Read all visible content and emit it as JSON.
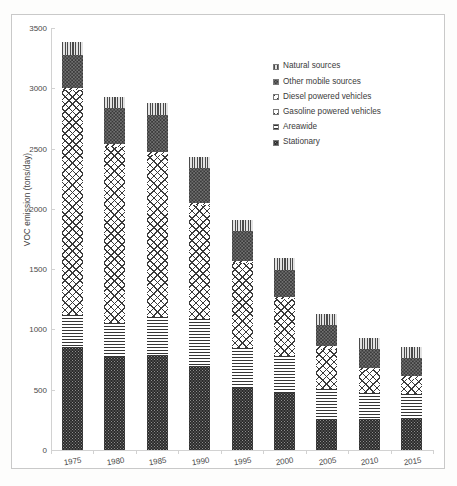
{
  "chart_data": {
    "type": "bar",
    "subtype": "stacked-vertical",
    "title": "",
    "xlabel": "",
    "ylabel": "VOC emission (tons/day)",
    "ylim": [
      0,
      3500
    ],
    "ytick_values": [
      0,
      500,
      1000,
      1500,
      2000,
      2500,
      3000,
      3500
    ],
    "ytick_labels": [
      "0",
      "500",
      "1000",
      "1500",
      "2000",
      "2500",
      "3000",
      "3500"
    ],
    "grid": false,
    "legend_position": "upper-right-inside",
    "categories": [
      "1975",
      "1980",
      "1985",
      "1990",
      "1995",
      "2000",
      "2005",
      "2010",
      "2015"
    ],
    "series": [
      {
        "name": "Stationary",
        "pattern": "dotted-dark",
        "stack_order": 1,
        "values": [
          855,
          775,
          790,
          700,
          515,
          475,
          260,
          255,
          265
        ]
      },
      {
        "name": "Areawide",
        "pattern": "horizontal-lines",
        "stack_order": 2,
        "values": [
          265,
          280,
          310,
          390,
          330,
          305,
          245,
          215,
          200
        ]
      },
      {
        "name": "Gasoline powered vehicles",
        "pattern": "cross-diagonal-hatch",
        "stack_order": 3,
        "values": [
          1865,
          1460,
          1350,
          940,
          710,
          470,
          330,
          190,
          120
        ]
      },
      {
        "name": "Diesel powered vehicles",
        "pattern": "diagonal-hatch",
        "stack_order": 4,
        "values": [
          15,
          25,
          20,
          20,
          15,
          20,
          25,
          20,
          25
        ]
      },
      {
        "name": "Other mobile sources",
        "pattern": "dotted-dark-coarse",
        "stack_order": 5,
        "values": [
          275,
          300,
          310,
          285,
          250,
          225,
          180,
          160,
          150
        ]
      },
      {
        "name": "Natural sources",
        "pattern": "vertical-lines",
        "stack_order": 6,
        "values": [
          105,
          85,
          100,
          95,
          85,
          95,
          90,
          90,
          95
        ]
      }
    ],
    "totals": [
      3380,
      2925,
      2880,
      2430,
      1905,
      1590,
      1130,
      930,
      855
    ]
  },
  "legend": {
    "items": [
      {
        "label": "Natural sources",
        "swatch": "vertical-lines-swatch"
      },
      {
        "label": "Other mobile sources",
        "swatch": "dotted-dark-coarse-swatch"
      },
      {
        "label": "Diesel powered vehicles",
        "swatch": "diagonal-hatch-swatch"
      },
      {
        "label": "Gasoline powered vehicles",
        "swatch": "cross-diagonal-hatch-swatch"
      },
      {
        "label": "Areawide",
        "swatch": "horizontal-lines-swatch"
      },
      {
        "label": "Stationary",
        "swatch": "dotted-dark-swatch"
      }
    ]
  }
}
